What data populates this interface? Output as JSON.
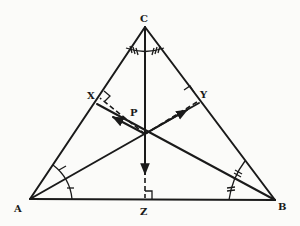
{
  "diagram": {
    "type": "geometry",
    "labels": {
      "A": "A",
      "B": "B",
      "C": "C",
      "X": "X",
      "Y": "Y",
      "Z": "Z",
      "P": "P"
    },
    "points": {
      "A": [
        30,
        199
      ],
      "B": [
        275,
        200
      ],
      "C": [
        145,
        27
      ],
      "I": [
        145,
        134
      ],
      "X": [
        99,
        97
      ],
      "Y": [
        198,
        100
      ],
      "Z": [
        145,
        199
      ]
    },
    "marks": {
      "angle_A": "single tick",
      "angle_B": "double tick",
      "angle_C": "triple tick",
      "right_angles": [
        "X",
        "Y",
        "Z"
      ]
    },
    "colors": {
      "ink": "#1a1a1a",
      "paper": "#fbfbf9"
    }
  }
}
